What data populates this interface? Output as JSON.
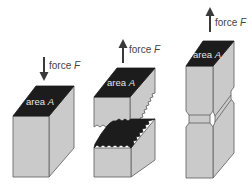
{
  "diagram": {
    "colors": {
      "block_fill": "#cacaca",
      "top_face": "#1c1c1c",
      "outline": "#6a6a6a",
      "arrow": "#3a3a3a"
    },
    "panels": [
      {
        "id": "compression",
        "force_label": "force ",
        "force_symbol": "F",
        "force_direction": "down",
        "area_label": "area ",
        "area_symbol": "A"
      },
      {
        "id": "fracture",
        "force_label": "force ",
        "force_symbol": "F",
        "force_direction": "up",
        "area_label": "area ",
        "area_symbol": "A"
      },
      {
        "id": "necking",
        "force_label": "force ",
        "force_symbol": "F",
        "force_direction": "up",
        "area_label": "area ",
        "area_symbol": "A"
      }
    ]
  }
}
